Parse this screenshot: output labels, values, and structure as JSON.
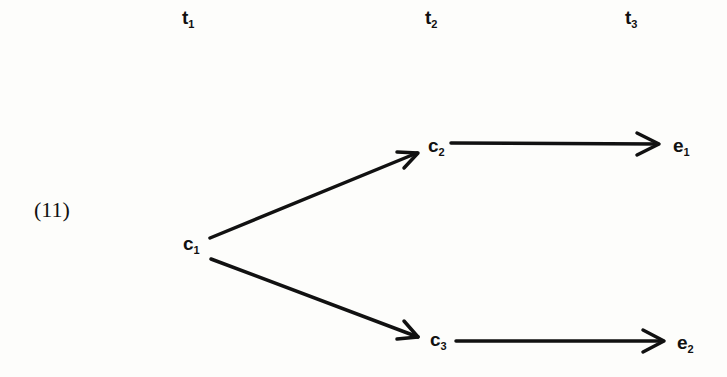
{
  "example_number": "(11)",
  "time_labels": [
    {
      "base": "t",
      "sub": "1"
    },
    {
      "base": "t",
      "sub": "2"
    },
    {
      "base": "t",
      "sub": "3"
    }
  ],
  "nodes": {
    "c1": {
      "base": "c",
      "sub": "1"
    },
    "c2": {
      "base": "c",
      "sub": "2"
    },
    "c3": {
      "base": "c",
      "sub": "3"
    },
    "e1": {
      "base": "e",
      "sub": "1"
    },
    "e2": {
      "base": "e",
      "sub": "2"
    }
  },
  "edges": [
    {
      "from": "c1",
      "to": "c2"
    },
    {
      "from": "c1",
      "to": "c3"
    },
    {
      "from": "c2",
      "to": "e1"
    },
    {
      "from": "c3",
      "to": "e2"
    }
  ]
}
